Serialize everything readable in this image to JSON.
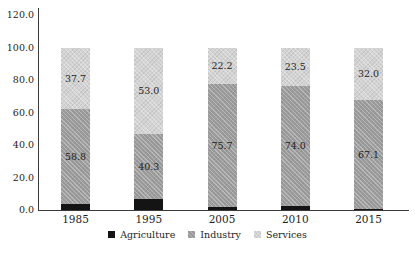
{
  "chart_data": {
    "type": "bar",
    "stacked": true,
    "title": "",
    "xlabel": "",
    "ylabel": "",
    "grid": false,
    "background_color": "#ffffff",
    "axis_color": "#3a3a3a",
    "text_color": "#1e1e1e",
    "categories": [
      "1985",
      "1995",
      "2005",
      "2010",
      "2015"
    ],
    "series": [
      {
        "name": "Agriculture",
        "color": "#141414",
        "textured": false,
        "values": [
          3.5,
          6.7,
          2.1,
          2.5,
          0.9
        ],
        "labels": [
          "",
          "",
          "",
          "",
          ""
        ]
      },
      {
        "name": "Industry",
        "color": "#9b9b9b",
        "textured": true,
        "values": [
          58.8,
          40.3,
          75.7,
          74.0,
          67.1
        ],
        "labels": [
          "58.8",
          "40.3",
          "75.7",
          "74.0",
          "67.1"
        ]
      },
      {
        "name": "Services",
        "color": "#d3d3d3",
        "textured": true,
        "values": [
          37.7,
          53.0,
          22.2,
          23.5,
          32.0
        ],
        "labels": [
          "37.7",
          "53.0",
          "22.2",
          "23.5",
          "32.0"
        ]
      }
    ],
    "y_axis": {
      "min": 0,
      "max": 120,
      "step": 20,
      "tick_labels": [
        "0.0",
        "20.0",
        "40.0",
        "60.0",
        "80.0",
        "100.0",
        "120.0"
      ]
    },
    "legend": {
      "position": "bottom",
      "entries": [
        "Agriculture",
        "Industry",
        "Services"
      ]
    }
  }
}
